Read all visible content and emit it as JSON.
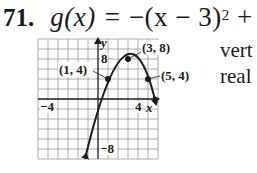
{
  "problem": {
    "number": "71.",
    "function_name": "g",
    "variable": "x",
    "expression_lhs": "g(x) = ",
    "expression_rhs_prefix": "−(x − 3)",
    "exponent": "2",
    "expression_rhs_suffix": " + 8"
  },
  "side_text": {
    "line1": "vert",
    "line2": "real"
  },
  "graph": {
    "axis_labels": {
      "x": "x",
      "y": "y"
    },
    "tick_labels": {
      "x_neg": "−4",
      "x_pos": "4",
      "y_pos": "8",
      "y_neg": "−8"
    },
    "points": [
      {
        "label": "(1, 4)",
        "x": 1,
        "y": 4
      },
      {
        "label": "(3, 8)",
        "x": 3,
        "y": 8
      },
      {
        "label": "(5, 4)",
        "x": 5,
        "y": 4
      }
    ],
    "x_range": [
      -6,
      6
    ],
    "y_range": [
      -12,
      12
    ],
    "curve_color": "#1a1a1a",
    "grid_color": "#9a9a9a"
  }
}
